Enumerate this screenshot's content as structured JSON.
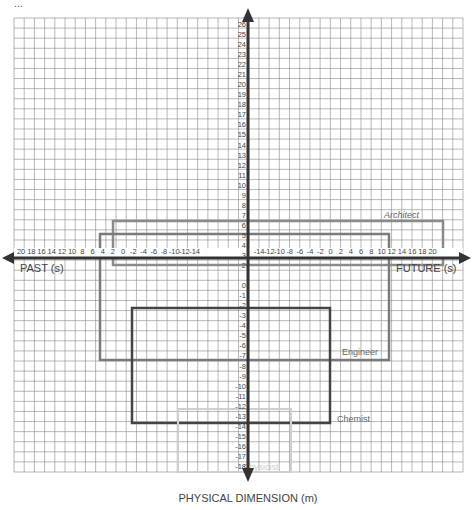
{
  "caption": "...",
  "chart_data": {
    "type": "diagram",
    "title": "",
    "xlabel_left": "PAST (s)",
    "xlabel_right": "FUTURE (s)",
    "ylabel": "PHYSICAL DIMENSION (m)",
    "x_ticks_left": [
      "20",
      "18",
      "16",
      "14",
      "12",
      "10",
      "8",
      "6",
      "4",
      "2",
      "0",
      "-2",
      "-4",
      "-6",
      "-8",
      "-10",
      "-12",
      "-14"
    ],
    "x_ticks_right": [
      "-14",
      "-12",
      "-10",
      "-8",
      "-6",
      "-4",
      "-2",
      "0",
      "2",
      "4",
      "6",
      "8",
      "10",
      "12",
      "14",
      "16",
      "18",
      "20"
    ],
    "y_ticks": [
      "26",
      "25",
      "24",
      "23",
      "22",
      "21",
      "20",
      "19",
      "18",
      "17",
      "16",
      "15",
      "14",
      "13",
      "12",
      "11",
      "10",
      "9",
      "8",
      "7",
      "6",
      "5",
      "4",
      "3",
      "2",
      "1",
      "0",
      "-1",
      "-2",
      "-3",
      "-4",
      "-5",
      "-6",
      "-7",
      "-8",
      "-9",
      "-10",
      "-11",
      "-12",
      "-13",
      "-14",
      "-15",
      "-16",
      "-17",
      "-18"
    ],
    "rectangles": [
      {
        "label": "Architect",
        "color": "#8a8a8a",
        "italic": true
      },
      {
        "label": "Engineer",
        "color": "#7a7a7a",
        "italic": false
      },
      {
        "label": "Chemist",
        "color": "#444444",
        "italic": false
      },
      {
        "label": "Physicist",
        "color": "#cfcfcf",
        "italic": false
      }
    ]
  }
}
